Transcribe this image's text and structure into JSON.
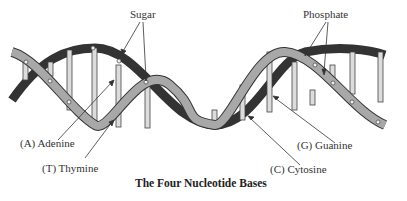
{
  "diagram": {
    "title": "The Four Nucleotide Bases",
    "labels": {
      "sugar": "Sugar",
      "phosphate": "Phosphate",
      "adenine": "(A) Adenine",
      "thymine": "(T) Thymine",
      "guanine": "(G) Guanine",
      "cytosine": "(C) Cytosine"
    },
    "colors": {
      "front_strand": "#a8a8a8",
      "back_strand": "#3a3a3a",
      "rung": "#d8d8d8",
      "outline": "#333333"
    }
  }
}
